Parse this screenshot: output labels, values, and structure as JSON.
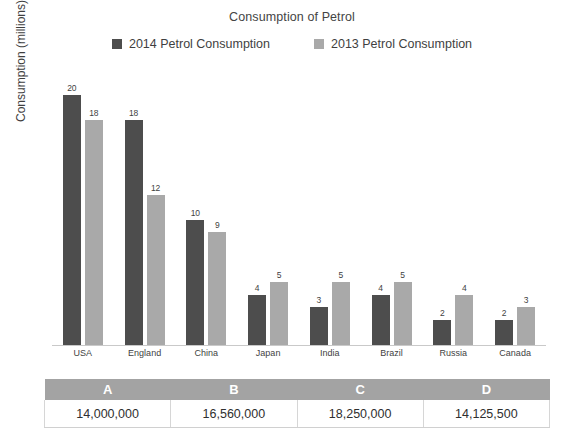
{
  "chart_data": {
    "type": "bar",
    "title": "Consumption of Petrol",
    "xlabel": "",
    "ylabel": "Consumption (millions) per day",
    "ylim": [
      0,
      22
    ],
    "grid": false,
    "legend_position": "top-center",
    "categories": [
      "USA",
      "England",
      "China",
      "Japan",
      "India",
      "Brazil",
      "Russia",
      "Canada"
    ],
    "series": [
      {
        "name": "2014 Petrol Consumption",
        "color": "#4d4d4d",
        "values": [
          20,
          18,
          10,
          4,
          3,
          4,
          2,
          2
        ]
      },
      {
        "name": "2013 Petrol Consumption",
        "color": "#a9a9a9",
        "values": [
          18,
          12,
          9,
          5,
          5,
          5,
          4,
          3
        ]
      }
    ]
  },
  "answer_table": {
    "headers": [
      "A",
      "B",
      "C",
      "D"
    ],
    "values": [
      "14,000,000",
      "16,560,000",
      "18,250,000",
      "14,125,500"
    ]
  }
}
